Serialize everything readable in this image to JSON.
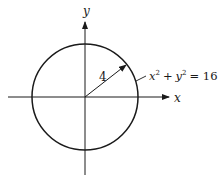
{
  "diagram": {
    "axes": {
      "x_label": "x",
      "y_label": "y"
    },
    "circle": {
      "center": [
        0,
        0
      ],
      "radius": 4,
      "radius_label": "4",
      "equation": {
        "x": "x",
        "y": "y",
        "exp": "2",
        "plus": "+",
        "equals": "= 16"
      }
    },
    "colors": {
      "stroke": "#1a1a1a",
      "background": "#ffffff"
    }
  }
}
